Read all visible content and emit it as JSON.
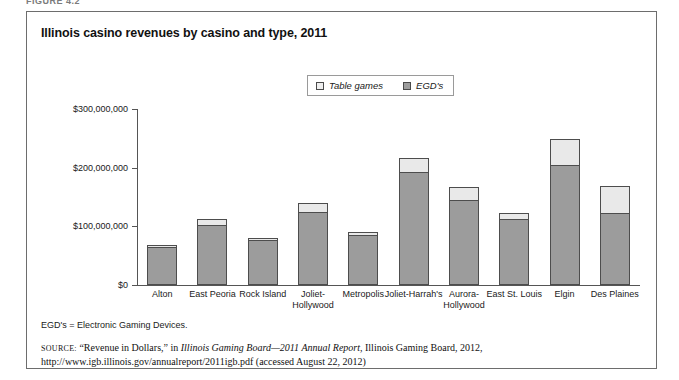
{
  "figure_label": "FIGURE 4.2",
  "title": "Illinois casino revenues by casino and type, 2011",
  "legend": {
    "items": [
      {
        "label": "Table games",
        "color": "#e9e9e9",
        "swatch": "legend-swatch-table-games"
      },
      {
        "label": "EGD's",
        "color": "#9c9c9c",
        "swatch": "legend-swatch-egds"
      }
    ]
  },
  "footnote": "EGD's = Electronic Gaming Devices.",
  "source": {
    "label": "SOURCE:",
    "part1": " “Revenue in Dollars,” in ",
    "italic": "Illinois Gaming Board—2011 Annual Report,",
    "part2": " Illinois Gaming Board, 2012, http://www.igb.illinois.gov/annualreport/2011igb.pdf (accessed August 22, 2012)"
  },
  "chart_data": {
    "type": "bar",
    "stacked": true,
    "title": "Illinois casino revenues by casino and type, 2011",
    "xlabel": "",
    "ylabel": "",
    "ylim": [
      0,
      300000000
    ],
    "yticks": [
      0,
      100000000,
      200000000,
      300000000
    ],
    "ytick_labels": [
      "$0",
      "$100,000,000",
      "$200,000,000",
      "$300,000,000"
    ],
    "grid": false,
    "legend_position": "top-center",
    "categories": [
      "Alton",
      "East Peoria",
      "Rock Island",
      "Joliet-Hollywood",
      "Metropolis",
      "Joliet-Harrah's",
      "Aurora-Hollywood",
      "East St. Louis",
      "Elgin",
      "Des Plaines"
    ],
    "series": [
      {
        "name": "EGD's",
        "color": "#9c9c9c",
        "values": [
          65000000,
          103000000,
          77000000,
          124000000,
          85000000,
          192000000,
          145000000,
          113000000,
          204000000,
          122000000
        ]
      },
      {
        "name": "Table games",
        "color": "#e9e9e9",
        "values": [
          3000000,
          9000000,
          3000000,
          16000000,
          5000000,
          25000000,
          22000000,
          9000000,
          45000000,
          47000000
        ]
      }
    ],
    "totals": [
      68000000,
      112000000,
      80000000,
      140000000,
      90000000,
      217000000,
      167000000,
      122000000,
      249000000,
      169000000
    ]
  }
}
